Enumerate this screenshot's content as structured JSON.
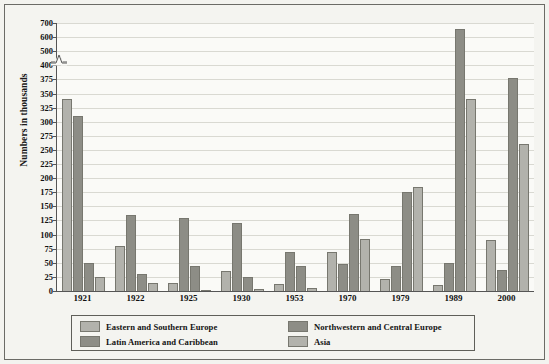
{
  "chart_data": {
    "type": "bar",
    "title": "",
    "xlabel": "",
    "ylabel": "Numbers in thousands",
    "categories": [
      "1921",
      "1922",
      "1925",
      "1930",
      "1953",
      "1970",
      "1979",
      "1989",
      "2000"
    ],
    "ytick_labels": [
      "700",
      "600",
      "500",
      "400",
      "375",
      "350",
      "325",
      "300",
      "275",
      "250",
      "225",
      "200",
      "175",
      "150",
      "125",
      "100",
      "75",
      "50",
      "25",
      "0"
    ],
    "ylim": [
      0,
      700
    ],
    "axis_break": "between 400 and 500",
    "grid": true,
    "legend_position": "bottom",
    "series": [
      {
        "name": "Eastern and Southern Europe",
        "color": "#b2b2ac",
        "values": [
          340,
          80,
          15,
          36,
          12,
          69,
          21,
          11,
          90
        ]
      },
      {
        "name": "Northwestern and Central Europe",
        "color": "#8d8d86",
        "values": [
          310,
          135,
          130,
          121,
          70,
          48,
          45,
          50,
          37
        ]
      },
      {
        "name": "Latin America and Caribbean",
        "color": "#8d8d86",
        "values": [
          50,
          30,
          44,
          25,
          45,
          136,
          175,
          655,
          378
        ]
      },
      {
        "name": "Asia",
        "color": "#b2b2ac",
        "values": [
          25,
          14,
          2,
          3,
          5,
          92,
          185,
          340,
          260
        ]
      }
    ]
  }
}
